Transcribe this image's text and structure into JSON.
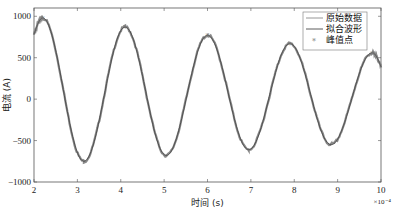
{
  "chart_data": {
    "type": "line",
    "title": "",
    "xlabel": "时间 (s)",
    "ylabel": "电流 (A)",
    "x_exponent_label": "×10⁻⁴",
    "xlim": [
      2,
      10
    ],
    "ylim": [
      -1000,
      1100
    ],
    "xticks": [
      2,
      3,
      4,
      5,
      6,
      7,
      8,
      9,
      10
    ],
    "xtick_labels": [
      "2",
      "3",
      "4",
      "5",
      "6",
      "7",
      "8",
      "9",
      "10"
    ],
    "yticks": [
      -1000,
      -500,
      0,
      500,
      1000
    ],
    "ytick_labels": [
      "−1000",
      "−500",
      "0",
      "500",
      "1000"
    ],
    "grid": false,
    "legend_position": "top-right",
    "signal": {
      "description": "damped sinusoid",
      "start_x": 2.0,
      "start_value": 780,
      "extrema": [
        {
          "x": 2.2,
          "value": 980
        },
        {
          "x": 3.15,
          "value": -750
        },
        {
          "x": 4.1,
          "value": 870
        },
        {
          "x": 5.05,
          "value": -680
        },
        {
          "x": 6.0,
          "value": 770
        },
        {
          "x": 6.95,
          "value": -610
        },
        {
          "x": 7.9,
          "value": 670
        },
        {
          "x": 8.85,
          "value": -550
        },
        {
          "x": 9.8,
          "value": 560
        }
      ],
      "end_x": 10.0,
      "end_value": 390
    },
    "series": [
      {
        "name": "原始数据",
        "style": "line",
        "color": "#8a8a8a"
      },
      {
        "name": "拟合波形",
        "style": "line",
        "color": "#4a4a4a"
      },
      {
        "name": "峰值点",
        "style": "marker",
        "color": "#777777"
      }
    ]
  }
}
